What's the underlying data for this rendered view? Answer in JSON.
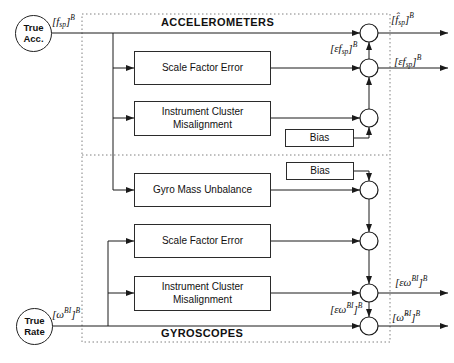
{
  "colors": {
    "line": "#1a1a1a",
    "dashed_border": "#808080",
    "block_border": "#2b2b2b",
    "background": "#ffffff"
  },
  "sections": {
    "accelerometers": {
      "title": "ACCELEROMETERS"
    },
    "gyroscopes": {
      "title": "GYROSCOPES"
    }
  },
  "terminals": {
    "true_acc": {
      "lines": [
        "True",
        "Acc."
      ]
    },
    "true_rate": {
      "lines": [
        "True",
        "Rate"
      ]
    }
  },
  "blocks": {
    "acc_scale_factor_error": {
      "lines": [
        "Scale Factor Error"
      ]
    },
    "acc_misalignment": {
      "lines": [
        "Instrument Cluster",
        "Misalignment"
      ]
    },
    "acc_bias": {
      "lines": [
        "Bias"
      ]
    },
    "gyro_bias": {
      "lines": [
        "Bias"
      ]
    },
    "gyro_mass_unbalance": {
      "lines": [
        "Gyro Mass Unbalance"
      ]
    },
    "gyro_scale_factor_error": {
      "lines": [
        "Scale Factor Error"
      ]
    },
    "gyro_misalignment": {
      "lines": [
        "Instrument Cluster",
        "Misalignment"
      ]
    }
  },
  "signals": {
    "f_true": {
      "open": "[",
      "sym": "f",
      "sub": "sp",
      "symsup": "",
      "close": "]",
      "sup": "B"
    },
    "f_hat": {
      "open": "[",
      "sym": "f̂",
      "sub": "sp",
      "symsup": "",
      "close": "]",
      "sup": "B"
    },
    "ef_mid": {
      "open": "[",
      "sym": "εf",
      "sub": "sp",
      "symsup": "",
      "close": "]",
      "sup": "B"
    },
    "ef_out": {
      "open": "[",
      "sym": "εf",
      "sub": "sp",
      "symsup": "",
      "close": "]",
      "sup": "B"
    },
    "w_true": {
      "open": "[",
      "sym": "ω",
      "sub": "",
      "symsup": "BI",
      "close": "]",
      "sup": "B"
    },
    "ew_out": {
      "open": "[",
      "sym": "εω",
      "sub": "",
      "symsup": "BI",
      "close": "]",
      "sup": "B"
    },
    "ew_mid": {
      "open": "[",
      "sym": "εω",
      "sub": "",
      "symsup": "BI",
      "close": "]",
      "sup": "B"
    },
    "w_hat": {
      "open": "[",
      "sym": "ω̂",
      "sub": "",
      "symsup": "BI",
      "close": "]",
      "sup": "B"
    }
  }
}
